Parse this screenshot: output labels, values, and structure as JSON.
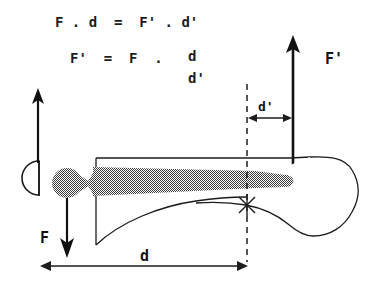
{
  "figure": {
    "type": "biomechanics-lever-diagram",
    "background_color": "#ffffff",
    "ink_color": "#1c1c1c",
    "shaded_fill_color": "#808080"
  },
  "equations": {
    "line1": "F . d  =  F' . d'",
    "line2_lhs": "F'  =  F  .",
    "line2_numerator": "d",
    "line2_denominator": "d'"
  },
  "labels": {
    "force_F": "F",
    "force_Fprime": "F'",
    "distance_d": "d",
    "distance_dprime": "d'"
  },
  "arrows": {
    "F_direction": "down",
    "Fprime_direction": "up",
    "d_dimension": "double-headed-horizontal",
    "dprime_dimension": "double-headed-horizontal"
  },
  "markers": {
    "pivot": "asterisk-cross"
  }
}
